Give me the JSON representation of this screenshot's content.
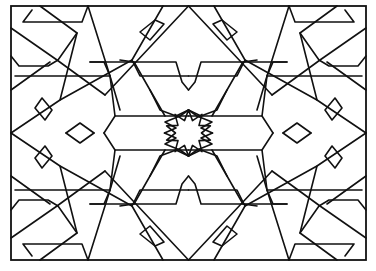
{
  "figure": {
    "stroke_color": "#111111",
    "background_color": "#ffffff",
    "frame": {
      "x": 11,
      "y": 6,
      "width": 355,
      "height": 254
    },
    "center": {
      "x": 188.5,
      "y": 133
    },
    "quadrant_paths": [
      "M40,6 L77,33 L58,60 L48,66 L19,66 L11,56",
      "M32,10 L23,22 L82,22 L88,6",
      "M11,28 L57,60 L105,95",
      "M15,76 L110,76 L104,62 L90,62",
      "M88,6 L110,76 L120,110",
      "M60,100 L77,33",
      "M11,90 L50,62",
      "M42,98 L52,110 L45,120 L35,108 Z",
      "M66,133 L80,123 L94,133",
      "M11,133 L60,100 L132,60 L163,6",
      "M105,95 L188.5,6",
      "M120,60 L134,62 L150,90 L160,110 L176,116 L188.5,110",
      "M90,62 L176,62 L182,82 L188.5,90",
      "M132,60 L140,76 L150,76 L188.5,76",
      "M110,76 L115,116 L150,116 L188.5,116",
      "M115,116 L104,133",
      "M150,90 L165,116",
      "M164,24 L150,40 L140,32 L155,20 Z",
      "M188.5,110 L180,116 L165,122 L176,128 L164.5,133"
    ]
  }
}
